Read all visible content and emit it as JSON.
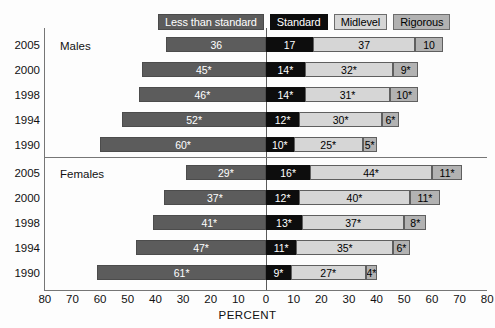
{
  "legend": {
    "items": [
      {
        "key": "less",
        "label": "Less than standard"
      },
      {
        "key": "standard",
        "label": "Standard"
      },
      {
        "key": "mid",
        "label": "Midlevel"
      },
      {
        "key": "rig",
        "label": "Rigorous"
      }
    ]
  },
  "axis": {
    "title": "PERCENT",
    "ticks": [
      "80",
      "70",
      "60",
      "50",
      "40",
      "30",
      "20",
      "10",
      "0",
      "10",
      "20",
      "30",
      "40",
      "50",
      "60",
      "70",
      "80"
    ]
  },
  "groups": [
    {
      "name": "Males"
    },
    {
      "name": "Females"
    }
  ],
  "chart_data": {
    "type": "bar",
    "title": "",
    "subtitle": "",
    "xlabel": "PERCENT",
    "ylabel": "",
    "orientation": "horizontal",
    "stacked": true,
    "diverging": true,
    "xlim": [
      -80,
      80
    ],
    "xticks": [
      -80,
      -70,
      -60,
      -50,
      -40,
      -30,
      -20,
      -10,
      0,
      10,
      20,
      30,
      40,
      50,
      60,
      70,
      80
    ],
    "xticklabels": [
      "80",
      "70",
      "60",
      "50",
      "40",
      "30",
      "20",
      "10",
      "0",
      "10",
      "20",
      "30",
      "40",
      "50",
      "60",
      "70",
      "80"
    ],
    "grid": false,
    "legend_position": "top",
    "series": [
      {
        "name": "Less than standard",
        "color": "#5c5c5c",
        "side": "left"
      },
      {
        "name": "Standard",
        "color": "#0d0d0d",
        "side": "right"
      },
      {
        "name": "Midlevel",
        "color": "#d6d6d6",
        "side": "right"
      },
      {
        "name": "Rigorous",
        "color": "#b2b2b2",
        "side": "right"
      }
    ],
    "annotations": {
      "asterisk_meaning": "significantly different from 2005"
    },
    "groups": [
      {
        "group": "Males",
        "rows": [
          {
            "year": "2005",
            "values": {
              "less": 36,
              "standard": 17,
              "mid": 37,
              "rig": 10
            },
            "labels": {
              "less": "36",
              "standard": "17",
              "mid": "37",
              "rig": "10"
            }
          },
          {
            "year": "2000",
            "values": {
              "less": 45,
              "standard": 14,
              "mid": 32,
              "rig": 9
            },
            "labels": {
              "less": "45*",
              "standard": "14*",
              "mid": "32*",
              "rig": "9*"
            }
          },
          {
            "year": "1998",
            "values": {
              "less": 46,
              "standard": 14,
              "mid": 31,
              "rig": 10
            },
            "labels": {
              "less": "46*",
              "standard": "14*",
              "mid": "31*",
              "rig": "10*"
            }
          },
          {
            "year": "1994",
            "values": {
              "less": 52,
              "standard": 12,
              "mid": 30,
              "rig": 6
            },
            "labels": {
              "less": "52*",
              "standard": "12*",
              "mid": "30*",
              "rig": "6*"
            }
          },
          {
            "year": "1990",
            "values": {
              "less": 60,
              "standard": 10,
              "mid": 25,
              "rig": 5
            },
            "labels": {
              "less": "60*",
              "standard": "10*",
              "mid": "25*",
              "rig": "5*"
            }
          }
        ]
      },
      {
        "group": "Females",
        "rows": [
          {
            "year": "2005",
            "values": {
              "less": 29,
              "standard": 16,
              "mid": 44,
              "rig": 11
            },
            "labels": {
              "less": "29*",
              "standard": "16*",
              "mid": "44*",
              "rig": "11*"
            }
          },
          {
            "year": "2000",
            "values": {
              "less": 37,
              "standard": 12,
              "mid": 40,
              "rig": 11
            },
            "labels": {
              "less": "37*",
              "standard": "12*",
              "mid": "40*",
              "rig": "11*"
            }
          },
          {
            "year": "1998",
            "values": {
              "less": 41,
              "standard": 13,
              "mid": 37,
              "rig": 8
            },
            "labels": {
              "less": "41*",
              "standard": "13*",
              "mid": "37*",
              "rig": "8*"
            }
          },
          {
            "year": "1994",
            "values": {
              "less": 47,
              "standard": 11,
              "mid": 35,
              "rig": 6
            },
            "labels": {
              "less": "47*",
              "standard": "11*",
              "mid": "35*",
              "rig": "6*"
            }
          },
          {
            "year": "1990",
            "values": {
              "less": 61,
              "standard": 9,
              "mid": 27,
              "rig": 4
            },
            "labels": {
              "less": "61*",
              "standard": "9*",
              "mid": "27*",
              "rig": "4*"
            }
          }
        ]
      }
    ]
  }
}
